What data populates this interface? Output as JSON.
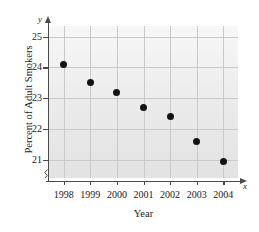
{
  "chart_data": {
    "type": "scatter",
    "title": "",
    "xlabel": "Year",
    "ylabel": "Percent of Adult Smokers",
    "x_axis_letter": "x",
    "y_axis_letter": "y",
    "categories": [
      "1998",
      "1999",
      "2000",
      "2001",
      "2002",
      "2003",
      "2004"
    ],
    "x": [
      1998,
      1999,
      2000,
      2001,
      2002,
      2003,
      2004
    ],
    "values": [
      24.1,
      23.5,
      23.2,
      22.7,
      22.4,
      21.6,
      20.95
    ],
    "series": [
      {
        "name": "Percent of Adult Smokers",
        "values": [
          24.1,
          23.5,
          23.2,
          22.7,
          22.4,
          21.6,
          20.95
        ]
      }
    ],
    "points": [
      {
        "year": "1998",
        "value": 24.1
      },
      {
        "year": "1999",
        "value": 23.5
      },
      {
        "year": "2000",
        "value": 23.2
      },
      {
        "year": "2001",
        "value": 22.7
      },
      {
        "year": "2002",
        "value": 22.4
      },
      {
        "year": "2003",
        "value": 21.6
      },
      {
        "year": "2004",
        "value": 20.95
      }
    ],
    "ytick_labels": [
      "25",
      "24",
      "23",
      "22",
      "21"
    ],
    "ytick_values": [
      25,
      24,
      23,
      22,
      21
    ],
    "xtick_labels": [
      "1998",
      "1999",
      "2000",
      "2001",
      "2002",
      "2003",
      "2004"
    ],
    "ylim": [
      20.4,
      25.35
    ],
    "xlim": [
      1997.45,
      2004.55
    ],
    "grid": true,
    "legend": "none",
    "y_axis_break": true,
    "colors": {
      "marker": "#131313",
      "grid": "#c9c9c9",
      "axis": "#4a4a4a",
      "plot_background": "#eaeaea",
      "figure_background": "#ffffff"
    }
  }
}
